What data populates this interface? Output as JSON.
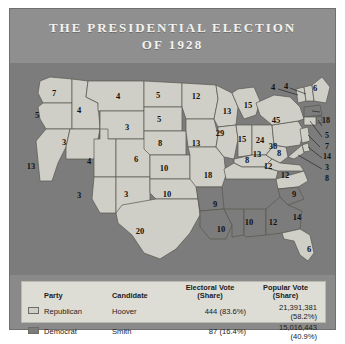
{
  "title": {
    "line1": "THE PRESIDENTIAL ELECTION",
    "line2": "OF 1928"
  },
  "colors": {
    "republican": "#cfcfc8",
    "democrat": "#7c7c7c",
    "map_background": "#7c7c7c",
    "plate": "#8a8a8a",
    "legend_panel": "#ddddd6",
    "title_text": "#f4f2ee",
    "label_text": "#14120f"
  },
  "legend": {
    "headers": {
      "party": "Party",
      "candidate": "Candidate",
      "electoral_l1": "Electoral Vote",
      "electoral_l2": "(Share)",
      "popular_l1": "Popular Vote",
      "popular_l2": "(Share)"
    },
    "rows": [
      {
        "party": "Republican",
        "candidate": "Hoover",
        "electoral": "444 (83.6%)",
        "popular": "21,391,381 (58.2%)",
        "swatch": "republican"
      },
      {
        "party": "Democrat",
        "candidate": "Smith",
        "electoral": "87 (16.4%)",
        "popular": "15,016,443 (40.9%)",
        "swatch": "democrat"
      }
    ]
  },
  "chart_data": {
    "type": "map",
    "title": "THE PRESIDENTIAL ELECTION OF 1928",
    "legend_position": "bottom",
    "categories": [
      "Republican",
      "Democrat"
    ],
    "series": [
      {
        "name": "Republican",
        "candidate": "Hoover",
        "electoral_votes": 444,
        "electoral_share": 83.6,
        "popular_votes": 21391381,
        "popular_share": 58.2
      },
      {
        "name": "Democrat",
        "candidate": "Smith",
        "electoral_votes": 87,
        "electoral_share": 16.4,
        "popular_votes": 15016443,
        "popular_share": 40.9
      }
    ],
    "states": [
      {
        "code": "WA",
        "electoral_votes": 7,
        "winner": "Republican"
      },
      {
        "code": "OR",
        "electoral_votes": 5,
        "winner": "Republican"
      },
      {
        "code": "CA",
        "electoral_votes": 13,
        "winner": "Republican"
      },
      {
        "code": "ID",
        "electoral_votes": 4,
        "winner": "Republican"
      },
      {
        "code": "NV",
        "electoral_votes": 3,
        "winner": "Republican"
      },
      {
        "code": "MT",
        "electoral_votes": 4,
        "winner": "Republican"
      },
      {
        "code": "WY",
        "electoral_votes": 3,
        "winner": "Republican"
      },
      {
        "code": "UT",
        "electoral_votes": 4,
        "winner": "Republican"
      },
      {
        "code": "CO",
        "electoral_votes": 6,
        "winner": "Republican"
      },
      {
        "code": "AZ",
        "electoral_votes": 3,
        "winner": "Republican"
      },
      {
        "code": "NM",
        "electoral_votes": 3,
        "winner": "Republican"
      },
      {
        "code": "ND",
        "electoral_votes": 5,
        "winner": "Republican"
      },
      {
        "code": "SD",
        "electoral_votes": 5,
        "winner": "Republican"
      },
      {
        "code": "NE",
        "electoral_votes": 8,
        "winner": "Republican"
      },
      {
        "code": "KS",
        "electoral_votes": 10,
        "winner": "Republican"
      },
      {
        "code": "OK",
        "electoral_votes": 10,
        "winner": "Republican"
      },
      {
        "code": "TX",
        "electoral_votes": 20,
        "winner": "Republican"
      },
      {
        "code": "MN",
        "electoral_votes": 12,
        "winner": "Republican"
      },
      {
        "code": "IA",
        "electoral_votes": 13,
        "winner": "Republican"
      },
      {
        "code": "MO",
        "electoral_votes": 18,
        "winner": "Republican"
      },
      {
        "code": "AR",
        "electoral_votes": 9,
        "winner": "Democrat"
      },
      {
        "code": "LA",
        "electoral_votes": 10,
        "winner": "Democrat"
      },
      {
        "code": "MS",
        "electoral_votes": 10,
        "winner": "Democrat"
      },
      {
        "code": "AL",
        "electoral_votes": 12,
        "winner": "Democrat"
      },
      {
        "code": "WI",
        "electoral_votes": 13,
        "winner": "Republican"
      },
      {
        "code": "IL",
        "electoral_votes": 29,
        "winner": "Republican"
      },
      {
        "code": "MI",
        "electoral_votes": 15,
        "winner": "Republican"
      },
      {
        "code": "IN",
        "electoral_votes": 15,
        "winner": "Republican"
      },
      {
        "code": "OH",
        "electoral_votes": 24,
        "winner": "Republican"
      },
      {
        "code": "KY",
        "electoral_votes": 13,
        "winner": "Republican"
      },
      {
        "code": "TN",
        "electoral_votes": 12,
        "winner": "Republican"
      },
      {
        "code": "WV",
        "electoral_votes": 8,
        "winner": "Republican"
      },
      {
        "code": "VA",
        "electoral_votes": 12,
        "winner": "Republican"
      },
      {
        "code": "NC",
        "electoral_votes": 12,
        "winner": "Republican"
      },
      {
        "code": "SC",
        "electoral_votes": 9,
        "winner": "Democrat"
      },
      {
        "code": "GA",
        "electoral_votes": 14,
        "winner": "Democrat"
      },
      {
        "code": "FL",
        "electoral_votes": 6,
        "winner": "Republican"
      },
      {
        "code": "PA",
        "electoral_votes": 38,
        "winner": "Republican"
      },
      {
        "code": "NY",
        "electoral_votes": 45,
        "winner": "Republican"
      },
      {
        "code": "VT",
        "electoral_votes": 4,
        "winner": "Republican"
      },
      {
        "code": "NH",
        "electoral_votes": 4,
        "winner": "Republican"
      },
      {
        "code": "ME",
        "electoral_votes": 6,
        "winner": "Republican"
      },
      {
        "code": "MA",
        "electoral_votes": 18,
        "winner": "Democrat"
      },
      {
        "code": "RI",
        "electoral_votes": 5,
        "winner": "Democrat"
      },
      {
        "code": "CT",
        "electoral_votes": 7,
        "winner": "Republican"
      },
      {
        "code": "NJ",
        "electoral_votes": 14,
        "winner": "Republican"
      },
      {
        "code": "DE",
        "electoral_votes": 3,
        "winner": "Republican"
      },
      {
        "code": "MD",
        "electoral_votes": 8,
        "winner": "Republican"
      }
    ]
  },
  "map_labels": [
    {
      "text": "7",
      "x": 44,
      "y": 30
    },
    {
      "text": "5",
      "x": 27,
      "y": 52
    },
    {
      "text": "4",
      "x": 69,
      "y": 47
    },
    {
      "text": "4",
      "x": 108,
      "y": 33
    },
    {
      "text": "3",
      "x": 54,
      "y": 79
    },
    {
      "text": "3",
      "x": 117,
      "y": 64
    },
    {
      "text": "13",
      "x": 21,
      "y": 103
    },
    {
      "text": "4",
      "x": 79,
      "y": 98
    },
    {
      "text": "6",
      "x": 126,
      "y": 96
    },
    {
      "text": "3",
      "x": 69,
      "y": 132
    },
    {
      "text": "3",
      "x": 116,
      "y": 131
    },
    {
      "text": "5",
      "x": 148,
      "y": 32
    },
    {
      "text": "5",
      "x": 149,
      "y": 56
    },
    {
      "text": "8",
      "x": 150,
      "y": 80
    },
    {
      "text": "10",
      "x": 154,
      "y": 105
    },
    {
      "text": "10",
      "x": 157,
      "y": 131
    },
    {
      "text": "20",
      "x": 130,
      "y": 168
    },
    {
      "text": "12",
      "x": 186,
      "y": 33
    },
    {
      "text": "13",
      "x": 186,
      "y": 80
    },
    {
      "text": "18",
      "x": 198,
      "y": 112
    },
    {
      "text": "9",
      "x": 205,
      "y": 141
    },
    {
      "text": "10",
      "x": 211,
      "y": 166
    },
    {
      "text": "13",
      "x": 217,
      "y": 48
    },
    {
      "text": "29",
      "x": 210,
      "y": 70
    },
    {
      "text": "15",
      "x": 238,
      "y": 42
    },
    {
      "text": "15",
      "x": 232,
      "y": 76
    },
    {
      "text": "24",
      "x": 250,
      "y": 77
    },
    {
      "text": "8",
      "x": 237,
      "y": 97
    },
    {
      "text": "10",
      "x": 239,
      "y": 159
    },
    {
      "text": "12",
      "x": 263,
      "y": 159
    },
    {
      "text": "14",
      "x": 287,
      "y": 154
    },
    {
      "text": "9",
      "x": 284,
      "y": 131
    },
    {
      "text": "12",
      "x": 275,
      "y": 112
    },
    {
      "text": "12",
      "x": 258,
      "y": 103
    },
    {
      "text": "13",
      "x": 247,
      "y": 91
    },
    {
      "text": "8",
      "x": 269,
      "y": 90
    },
    {
      "text": "6",
      "x": 299,
      "y": 186
    },
    {
      "text": "45",
      "x": 266,
      "y": 57
    },
    {
      "text": "38",
      "x": 263,
      "y": 83
    },
    {
      "text": "4",
      "x": 263,
      "y": 24
    },
    {
      "text": "4",
      "x": 276,
      "y": 23
    },
    {
      "text": "6",
      "x": 305,
      "y": 25
    }
  ],
  "map_side_labels": [
    {
      "text": "18",
      "x": 312,
      "y": 57
    },
    {
      "text": "5",
      "x": 315,
      "y": 72
    },
    {
      "text": "7",
      "x": 315,
      "y": 83
    },
    {
      "text": "14",
      "x": 313,
      "y": 93
    },
    {
      "text": "3",
      "x": 315,
      "y": 104
    },
    {
      "text": "8",
      "x": 315,
      "y": 115
    }
  ]
}
